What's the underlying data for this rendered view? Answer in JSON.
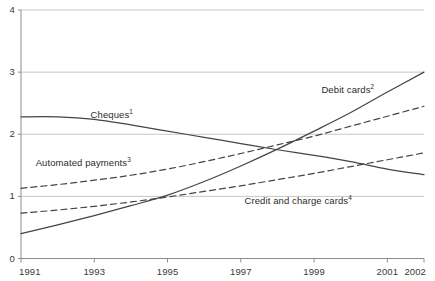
{
  "chart_data": {
    "type": "line",
    "title": "",
    "subtitle": "",
    "xlabel": "",
    "ylabel": "",
    "xlim": [
      1991,
      2002
    ],
    "ylim": [
      0,
      4
    ],
    "grid": "horizontal",
    "legend_position": "inline-annotations",
    "x": [
      1991,
      1992,
      1993,
      1994,
      1995,
      1996,
      1997,
      1998,
      1999,
      2000,
      2001,
      2002
    ],
    "x_tick_labels": [
      "1991",
      "1993",
      "1995",
      "1997",
      "1999",
      "2001",
      "2002"
    ],
    "x_tick_values": [
      1991,
      1993,
      1995,
      1997,
      1999,
      2001,
      2002
    ],
    "y_tick_labels": [
      "0",
      "1",
      "2",
      "3",
      "4"
    ],
    "y_tick_values": [
      0,
      1,
      2,
      3,
      4
    ],
    "series": [
      {
        "name": "Cheques",
        "label": "Cheques",
        "superscript": "1",
        "style": "solid",
        "color": "#444444",
        "label_x": 1992.9,
        "label_y": 2.31,
        "values": [
          2.28,
          2.28,
          2.24,
          2.15,
          2.05,
          1.95,
          1.85,
          1.75,
          1.66,
          1.56,
          1.44,
          1.35
        ]
      },
      {
        "name": "Automated payments",
        "label": "Automated payments",
        "superscript": "3",
        "style": "dashed",
        "color": "#444444",
        "label_x": 1991.4,
        "label_y": 1.53,
        "values": [
          1.13,
          1.19,
          1.26,
          1.34,
          1.44,
          1.56,
          1.69,
          1.83,
          1.97,
          2.13,
          2.29,
          2.45
        ]
      },
      {
        "name": "Credit and charge cards",
        "label": "Credit and charge cards",
        "superscript": "4",
        "style": "dashed",
        "color": "#444444",
        "label_x": 1997.1,
        "label_y": 0.93,
        "values": [
          0.73,
          0.78,
          0.84,
          0.91,
          0.99,
          1.08,
          1.17,
          1.27,
          1.37,
          1.48,
          1.59,
          1.7
        ]
      },
      {
        "name": "Debit cards",
        "label": "Debit cards",
        "superscript": "2",
        "style": "solid",
        "color": "#444444",
        "label_x": 1999.2,
        "label_y": 2.72,
        "values": [
          0.4,
          0.54,
          0.69,
          0.85,
          1.02,
          1.24,
          1.49,
          1.76,
          2.05,
          2.35,
          2.68,
          3.0
        ]
      }
    ],
    "axis_color": "#8c8c8c",
    "grid_color": "#b8b8b8",
    "background": "#ffffff"
  }
}
